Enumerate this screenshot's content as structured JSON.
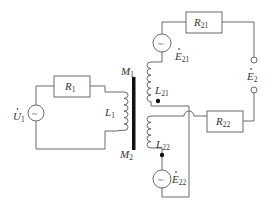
{
  "diagram": {
    "title": "",
    "type": "transformer circuit",
    "colors": {
      "wire": "#6a6a6a",
      "core": "#111111",
      "text": "#333333",
      "background": "#ffffff"
    },
    "components": {
      "source_u1": {
        "symbol": "~",
        "label_main": "U",
        "label_sub": "1",
        "label_dot": "·"
      },
      "resistor_r1": {
        "label_main": "R",
        "label_sub": "1"
      },
      "inductor_l1": {
        "label_main": "L",
        "label_sub": "1"
      },
      "core": {
        "top_label_main": "M",
        "top_label_sub": "1",
        "bottom_label_main": "M",
        "bottom_label_sub": "2"
      },
      "inductor_l21": {
        "label_main": "L",
        "label_sub": "21"
      },
      "inductor_l22": {
        "label_main": "L",
        "label_sub": "22"
      },
      "source_e21": {
        "symbol": "~",
        "label_main": "E",
        "label_sub": "21",
        "label_dot": "·"
      },
      "source_e22": {
        "symbol": "~",
        "label_main": "E",
        "label_sub": "22",
        "label_dot": "·"
      },
      "resistor_r21": {
        "label_main": "R",
        "label_sub": "21"
      },
      "resistor_r22": {
        "label_main": "R",
        "label_sub": "22"
      },
      "output_e2": {
        "label_main": "E",
        "label_sub": "2",
        "label_dot": "·"
      }
    }
  }
}
